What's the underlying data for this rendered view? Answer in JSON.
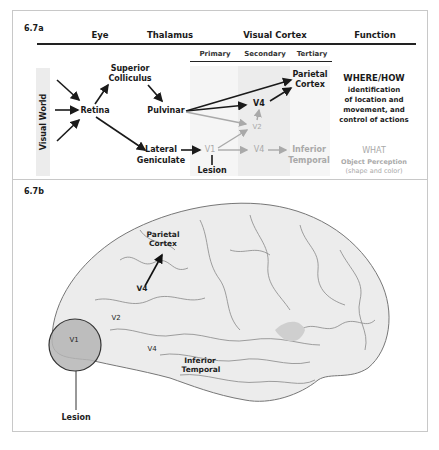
{
  "panel_a": {
    "label": "6.7a",
    "columns": {
      "eye": "Eye",
      "thalamus": "Thalamus",
      "visual_cortex": "Visual Cortex",
      "function": "Function"
    },
    "subcolumns": {
      "primary": "Primary",
      "secondary": "Secondary",
      "tertiary": "Tertiary"
    },
    "visual_world": "Visual World",
    "nodes": {
      "retina": "Retina",
      "superior_colliculus_1": "Superior",
      "superior_colliculus_2": "Colliculus",
      "pulvinar": "Pulvinar",
      "lateral_geniculate_1": "Lateral",
      "lateral_geniculate_2": "Geniculate",
      "v1": "V1",
      "lesion": "Lesion",
      "v2": "V2",
      "v4_upper": "V4",
      "v4_lower": "V4",
      "parietal_cortex_1": "Parietal",
      "parietal_cortex_2": "Cortex",
      "inferior_temporal_1": "Inferior",
      "inferior_temporal_2": "Temporal"
    },
    "functions": {
      "where_title": "WHERE/HOW",
      "where_desc": [
        "identification",
        "of location and",
        "movement, and",
        "control of actions"
      ],
      "what_title": "WHAT",
      "what_desc": [
        "Object Perception",
        "(shape and color)"
      ]
    },
    "colors": {
      "dark_pathway": "#1a1a1a",
      "light_pathway": "#a9a9a9",
      "shade": "#ececec"
    }
  },
  "panel_b": {
    "label": "6.7b",
    "labels": {
      "parietal_cortex_1": "Parietal",
      "parietal_cortex_2": "Cortex",
      "v4_upper": "V4",
      "v2": "V2",
      "v1": "V1",
      "v4_lower": "V4",
      "inferior_temporal_1": "Inferior",
      "inferior_temporal_2": "Temporal",
      "lesion": "Lesion"
    },
    "colors": {
      "brain_fill": "#ececec",
      "brain_stroke": "#777777",
      "lesion_fill": "#b5b5b5"
    }
  }
}
